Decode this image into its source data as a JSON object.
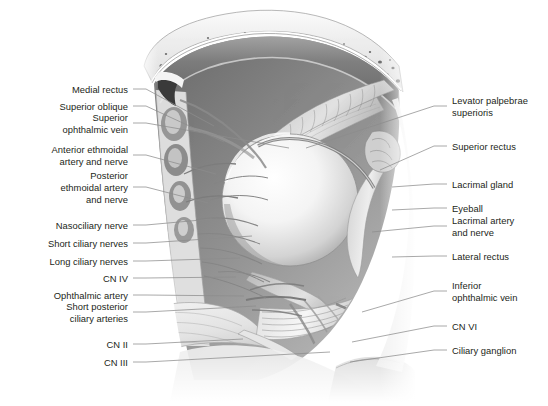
{
  "figure": {
    "domain_note": "grayscale anatomical illustration with leader-line callouts",
    "background_color": "#ffffff",
    "text_color": "#231f20",
    "leader_color": "#8c8c8c"
  },
  "labels_left": [
    {
      "id": "medial-rectus",
      "text": "Medial rectus",
      "x": 128,
      "y": 89,
      "lines": 1,
      "leader_to_x": 214,
      "leader_to_y": 126
    },
    {
      "id": "superior-oblique",
      "text": "Superior oblique",
      "x": 128,
      "y": 106,
      "lines": 1,
      "leader_to_x": 224,
      "leader_to_y": 142
    },
    {
      "id": "superior-ophthalmic-vein",
      "text": "Superior\nophthalmic vein",
      "x": 128,
      "y": 123,
      "lines": 2,
      "leader_to_x": 289,
      "leader_to_y": 148
    },
    {
      "id": "anterior-ethmoidal",
      "text": "Anterior ethmoidal\nartery and nerve",
      "x": 128,
      "y": 155,
      "lines": 2,
      "leader_to_x": 216,
      "leader_to_y": 174
    },
    {
      "id": "posterior-ethmoidal",
      "text": "Posterior\nethmoidal artery\nand nerve",
      "x": 128,
      "y": 187,
      "lines": 3,
      "leader_to_x": 208,
      "leader_to_y": 203
    },
    {
      "id": "nasociliary-nerve",
      "text": "Nasociliary nerve",
      "x": 128,
      "y": 225,
      "lines": 1,
      "leader_to_x": 212,
      "leader_to_y": 219
    },
    {
      "id": "short-ciliary-nerves",
      "text": "Short ciliary nerves",
      "x": 128,
      "y": 243,
      "lines": 1,
      "leader_to_x": 252,
      "leader_to_y": 236
    },
    {
      "id": "long-ciliary-nerves",
      "text": "Long ciliary nerves",
      "x": 128,
      "y": 261,
      "lines": 1,
      "leader_to_x": 240,
      "leader_to_y": 258
    },
    {
      "id": "cn-iv",
      "text": "CN IV",
      "x": 128,
      "y": 278,
      "lines": 1,
      "leader_to_x": 236,
      "leader_to_y": 277
    },
    {
      "id": "ophthalmic-artery",
      "text": "Ophthalmic artery",
      "x": 128,
      "y": 295,
      "lines": 1,
      "leader_to_x": 244,
      "leader_to_y": 296
    },
    {
      "id": "short-posterior-ciliary",
      "text": "Short posterior\nciliary arteries",
      "x": 128,
      "y": 312,
      "lines": 2,
      "leader_to_x": 256,
      "leader_to_y": 306
    },
    {
      "id": "cn-ii",
      "text": "CN II",
      "x": 128,
      "y": 344,
      "lines": 1,
      "leader_to_x": 243,
      "leader_to_y": 339
    },
    {
      "id": "cn-iii",
      "text": "CN III",
      "x": 128,
      "y": 362,
      "lines": 1,
      "leader_to_x": 330,
      "leader_to_y": 352
    }
  ],
  "labels_right": [
    {
      "id": "levator-palpebrae",
      "text": "Levator palpebrae\nsuperioris",
      "x": 452,
      "y": 106,
      "lines": 2,
      "leader_to_x": 306,
      "leader_to_y": 148
    },
    {
      "id": "superior-rectus",
      "text": "Superior rectus",
      "x": 452,
      "y": 146,
      "lines": 1,
      "leader_to_x": 380,
      "leader_to_y": 170
    },
    {
      "id": "lacrimal-gland",
      "text": "Lacrimal gland",
      "x": 452,
      "y": 184,
      "lines": 1,
      "leader_to_x": 392,
      "leader_to_y": 187
    },
    {
      "id": "eyeball",
      "text": "Eyeball",
      "x": 452,
      "y": 208,
      "lines": 1,
      "leader_to_x": 392,
      "leader_to_y": 210
    },
    {
      "id": "lacrimal-artery-nerve",
      "text": "Lacrimal artery\nand nerve",
      "x": 452,
      "y": 226,
      "lines": 2,
      "leader_to_x": 372,
      "leader_to_y": 232
    },
    {
      "id": "lateral-rectus",
      "text": "Lateral rectus",
      "x": 452,
      "y": 256,
      "lines": 1,
      "leader_to_x": 392,
      "leader_to_y": 257
    },
    {
      "id": "inferior-ophthalmic-vein",
      "text": "Inferior\nophthalmic vein",
      "x": 452,
      "y": 291,
      "lines": 2,
      "leader_to_x": 362,
      "leader_to_y": 312
    },
    {
      "id": "cn-vi",
      "text": "CN VI",
      "x": 452,
      "y": 326,
      "lines": 1,
      "leader_to_x": 352,
      "leader_to_y": 342
    },
    {
      "id": "ciliary-ganglion",
      "text": "Ciliary ganglion",
      "x": 452,
      "y": 350,
      "lines": 1,
      "leader_to_x": 350,
      "leader_to_y": 362
    }
  ]
}
